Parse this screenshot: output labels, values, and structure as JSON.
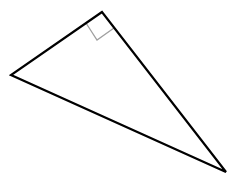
{
  "diagram": {
    "type": "right-triangle",
    "vertices": {
      "right_angle": [
        102,
        12
      ],
      "left": [
        11,
        75
      ],
      "bottom_right": [
        226,
        172
      ]
    },
    "right_angle_marker": [
      [
        86,
        23
      ],
      [
        97,
        40
      ],
      [
        114,
        28
      ]
    ],
    "colors": {
      "background": "#ffffff",
      "edge": "#000000",
      "marker": "#a0a0a0"
    }
  }
}
